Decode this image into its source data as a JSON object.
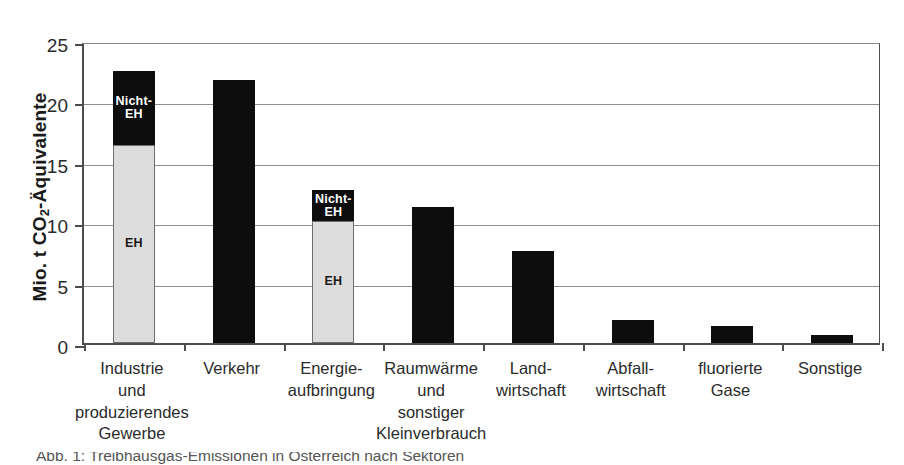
{
  "chart_data": {
    "type": "bar",
    "title": "",
    "subtitle": "",
    "xlabel": "",
    "ylabel": "Mio. t CO2-Äquivalente",
    "ylabel_parts": {
      "prefix": "Mio. t CO",
      "sub": "2",
      "suffix": "-Äquivalente"
    },
    "ylim": [
      0,
      25
    ],
    "yticks": [
      0,
      5,
      10,
      15,
      20,
      25
    ],
    "ytick_labels": [
      "0",
      "5",
      "10",
      "15",
      "20",
      "25"
    ],
    "grid": true,
    "grid_axis": "y",
    "legend": "none",
    "stacked": true,
    "categories": [
      "Industrie und produzierendes Gewerbe",
      "Verkehr",
      "Energieaufbringung",
      "Raumwärme und sonstiger Kleinverbrauch",
      "Landwirtschaft",
      "Abfallwirtschaft",
      "fluorierte Gase",
      "Sonstige"
    ],
    "category_lines": [
      [
        "Industrie",
        "und",
        "produzierendes",
        "Gewerbe"
      ],
      [
        "Verkehr"
      ],
      [
        "Energie-",
        "aufbringung"
      ],
      [
        "Raumwärme",
        "und",
        "sonstiger",
        "Kleinverbrauch"
      ],
      [
        "Land-",
        "wirtschaft"
      ],
      [
        "Abfall-",
        "wirtschaft"
      ],
      [
        "fluorierte",
        "Gase"
      ],
      [
        "Sonstige"
      ]
    ],
    "series": [
      {
        "name": "EH",
        "color": "#dcdcdc",
        "values": [
          16.4,
          0,
          10.1,
          0,
          0,
          0,
          0,
          0
        ]
      },
      {
        "name": "Nicht-EH",
        "color": "#0d0d0d",
        "values": [
          6.1,
          21.8,
          2.6,
          11.3,
          7.6,
          1.9,
          1.4,
          0.7
        ]
      }
    ],
    "totals": [
      22.5,
      21.8,
      12.7,
      11.3,
      7.6,
      1.9,
      1.4,
      0.7
    ],
    "in_bar_labels": [
      {
        "category_index": 0,
        "segment": "Nicht-EH",
        "text": "Nicht-\nEH"
      },
      {
        "category_index": 0,
        "segment": "EH",
        "text": "EH"
      },
      {
        "category_index": 2,
        "segment": "Nicht-EH",
        "text": "Nicht-\nEH"
      },
      {
        "category_index": 2,
        "segment": "EH",
        "text": "EH"
      }
    ],
    "labels": {
      "eh": "EH",
      "nicht_eh_line1": "Nicht-",
      "nicht_eh_line2": "EH"
    },
    "colors": {
      "eh_fill": "#dcdcdc",
      "eh_border": "#6e6e6e",
      "nicht_eh_fill": "#0d0d0d",
      "axis": "#4d4d4d",
      "grid": "#8f8f8f",
      "text": "#2b2b2b",
      "background": "#ffffff"
    }
  },
  "caption_sliver": "Abb. 1: Treibhausgas-Emissionen in Österreich nach Sektoren"
}
